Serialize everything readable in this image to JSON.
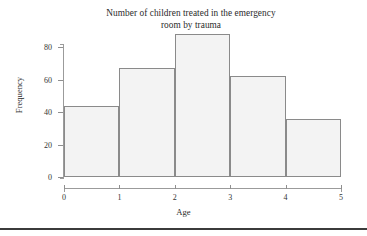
{
  "chart_data": {
    "type": "bar",
    "title": "Number of children treated in the emergency room by trauma",
    "title_line1": "Number of children treated in the emergency",
    "title_line2": "room by trauma",
    "xlabel": "Age",
    "ylabel": "Frequency",
    "categories": [
      "0-1",
      "1-2",
      "2-3",
      "3-4",
      "4-5"
    ],
    "bin_edges": [
      0,
      1,
      2,
      3,
      4,
      5
    ],
    "values": [
      44,
      67,
      88,
      62,
      36
    ],
    "xlim": [
      0,
      5
    ],
    "ylim": [
      0,
      88
    ],
    "x_ticks": [
      "0",
      "1",
      "2",
      "3",
      "4",
      "5"
    ],
    "x_tick_values": [
      0,
      1,
      2,
      3,
      4,
      5
    ],
    "y_ticks": [
      "0",
      "20",
      "40",
      "60",
      "80"
    ],
    "y_tick_values": [
      0,
      20,
      40,
      60,
      80
    ],
    "grid": false,
    "legend": false,
    "bar_fill_color": "#f3f3f3",
    "bar_edge_color": "#8a8a8a",
    "axis_color": "#9b9b9b",
    "text_color": "#2b2b2b",
    "background_color": "#ffffff"
  }
}
